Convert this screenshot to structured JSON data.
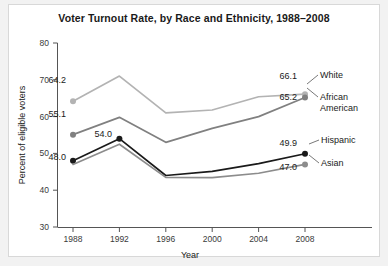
{
  "chart_data": {
    "type": "line",
    "title": "Voter Turnout Rate, by Race and Ethnicity, 1988–2008",
    "xlabel": "Year",
    "ylabel": "Percent of eligible voters",
    "categories": [
      "1988",
      "1992",
      "1996",
      "2000",
      "2004",
      "2008"
    ],
    "x": [
      1988,
      1992,
      1996,
      2000,
      2004,
      2008
    ],
    "xlim": [
      1986,
      2010
    ],
    "ylim": [
      30,
      80
    ],
    "yticks": [
      "30",
      "40",
      "50",
      "60",
      "70",
      "80"
    ],
    "ytick_values": [
      30,
      40,
      50,
      60,
      70,
      80
    ],
    "grid": false,
    "legend_position": "right-inline-labels",
    "series": [
      {
        "name": "White",
        "color": "#b3b3b3",
        "values": [
          64.2,
          71.0,
          61.0,
          61.8,
          65.4,
          66.1
        ],
        "start_label": "64.2",
        "end_label": "66.1"
      },
      {
        "name": "African American",
        "color": "#808080",
        "values": [
          55.1,
          59.8,
          53.0,
          56.8,
          60.0,
          65.2
        ],
        "start_label": "55.1",
        "end_label": "65.2"
      },
      {
        "name": "Hispanic",
        "color": "#1a1a1a",
        "values": [
          48.0,
          54.0,
          44.0,
          45.1,
          47.2,
          49.9
        ],
        "start_label": "48.0",
        "end_label": "49.9",
        "peak_label": "54.0"
      },
      {
        "name": "Asian",
        "color": "#8c8c8c",
        "values": [
          47.0,
          52.5,
          43.5,
          43.4,
          44.6,
          47.0
        ],
        "end_label": "47.0"
      }
    ],
    "annotations": [
      {
        "text": "64.2",
        "series": "White",
        "point": "1988"
      },
      {
        "text": "55.1",
        "series": "African American",
        "point": "1988"
      },
      {
        "text": "54.0",
        "series": "Hispanic",
        "point": "1992"
      },
      {
        "text": "48.0",
        "series": "Hispanic",
        "point": "1988"
      },
      {
        "text": "66.1",
        "series": "White",
        "point": "2008"
      },
      {
        "text": "65.2",
        "series": "African American",
        "point": "2008"
      },
      {
        "text": "49.9",
        "series": "Hispanic",
        "point": "2008"
      },
      {
        "text": "47.0",
        "series": "Asian",
        "point": "2008"
      }
    ]
  },
  "labels": {
    "white": "White",
    "african_american_line1": "African",
    "african_american_line2": "American",
    "hispanic": "Hispanic",
    "asian": "Asian",
    "v_64_2": "64.2",
    "v_55_1": "55.1",
    "v_54_0": "54.0",
    "v_48_0": "48.0",
    "v_66_1": "66.1",
    "v_65_2": "65.2",
    "v_49_9": "49.9",
    "v_47_0": "47.0",
    "y_30": "30",
    "y_40": "40",
    "y_50": "50",
    "y_60": "60",
    "y_70": "70",
    "y_80": "80",
    "x_1988": "1988",
    "x_1992": "1992",
    "x_1996": "1996",
    "x_2000": "2000",
    "x_2004": "2004",
    "x_2008": "2008"
  }
}
